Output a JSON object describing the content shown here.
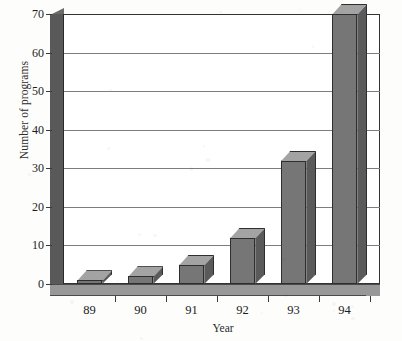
{
  "chart_data": {
    "type": "bar",
    "title": "",
    "xlabel": "Year",
    "ylabel": "Number of programs",
    "categories": [
      "89",
      "90",
      "91",
      "92",
      "93",
      "94"
    ],
    "values": [
      1,
      2,
      5,
      12,
      32,
      70
    ],
    "ylim": [
      0,
      70
    ],
    "ytick_values": [
      0,
      10,
      20,
      30,
      40,
      50,
      60,
      70
    ],
    "ytick_labels": [
      "0",
      "10",
      "20",
      "30",
      "40",
      "50",
      "60",
      "70"
    ],
    "grid": "horizontal",
    "legend": "none",
    "style": "3d-bars-grayscale",
    "series": [
      {
        "name": "Number of programs",
        "values": [
          1,
          2,
          5,
          12,
          32,
          70
        ]
      }
    ],
    "colors": {
      "bar_front": "#767676",
      "bar_side": "#5a5a5a",
      "bar_top": "#a3a3a3",
      "gridline": "#7d7d7d",
      "axis": "#333333",
      "wall": "#595959",
      "floor": "#989898",
      "background": "#ffffff",
      "text": "#1c1c1c"
    }
  }
}
